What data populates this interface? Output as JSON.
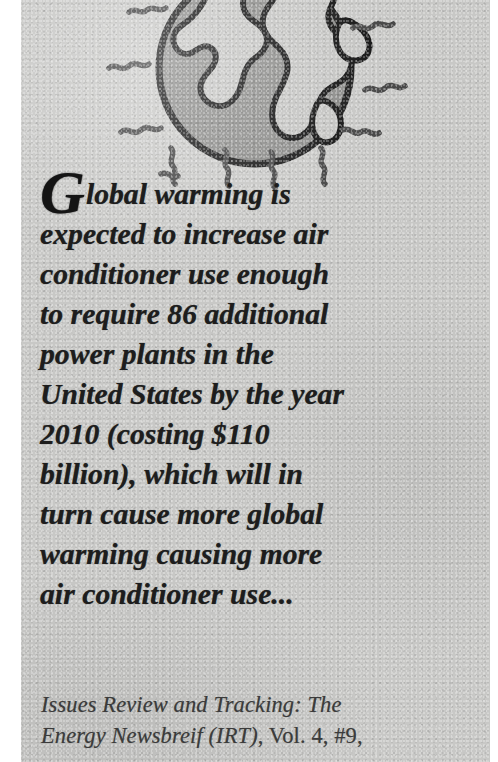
{
  "document": {
    "type": "scanned-newsletter-pullquote",
    "background_color": "#c8c8c6",
    "ink_color": "#1d1d1d"
  },
  "illustration": {
    "name": "globe-with-heat-waves",
    "globe_fill": "#8d8d8b",
    "globe_outline": "#1b1b1b",
    "continent_fill": "#c4c4c2",
    "squiggle_color": "#4a4a4a",
    "description": "Earth globe radiating squiggly heat waves"
  },
  "pullquote": {
    "dropcap": "G",
    "lines": [
      "lobal warming is",
      "expected to increase air",
      "conditioner use enough",
      "to require 86 additional",
      "power plants in the",
      "United States by the year",
      "2010 (costing $110",
      "billion), which will in",
      "turn cause more global",
      "warming causing more",
      "air conditioner use..."
    ],
    "full_text": "Global warming is expected to increase air conditioner use enough to require 86 additional power plants in the United States by the year 2010 (costing $110 billion), which will in turn cause more global warming causing more air conditioner use..."
  },
  "citation": {
    "line1": "Issues Review and Tracking: The",
    "line2_italic": "Energy Newsbreif (IRT)",
    "line2_roman": ", Vol. 4, #9,",
    "source_title": "Issues Review and Tracking: The Energy Newsbreif",
    "abbreviation": "IRT",
    "volume": "Vol. 4",
    "issue": "#9"
  }
}
